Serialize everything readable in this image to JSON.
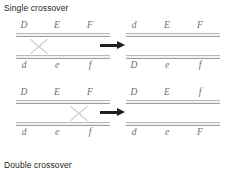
{
  "figure": {
    "caption_top": "Single crossover",
    "caption_bottom": "Double crossover"
  },
  "rows": [
    {
      "id": "single-crossover",
      "before": {
        "top_alleles": [
          "D",
          "E",
          "F"
        ],
        "bottom_alleles": [
          "d",
          "e",
          "f"
        ],
        "crossover_position": "between-D-and-E"
      },
      "arrow": "right-arrow",
      "after": {
        "top_alleles": [
          "d",
          "E",
          "F"
        ],
        "bottom_alleles": [
          "D",
          "e",
          "f"
        ]
      }
    },
    {
      "id": "double-crossover",
      "before": {
        "top_alleles": [
          "D",
          "E",
          "F"
        ],
        "bottom_alleles": [
          "d",
          "e",
          "f"
        ],
        "crossover_position": "between-E-and-F"
      },
      "arrow": "right-arrow",
      "after": {
        "top_alleles": [
          "D",
          "E",
          "f"
        ],
        "bottom_alleles": [
          "d",
          "e",
          "F"
        ]
      }
    }
  ],
  "colors": {
    "text": "#231f20",
    "allele": "#6e6e6e",
    "chromosome": "#b9b9b9",
    "arrow": "#231f20",
    "background": "#ffffff"
  }
}
